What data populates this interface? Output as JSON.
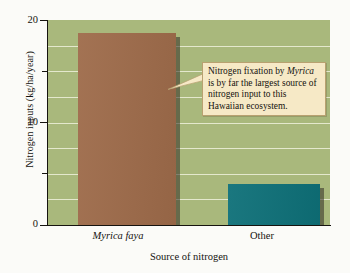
{
  "chart_data": {
    "type": "bar",
    "title": "",
    "categories": [
      "Myrica faya",
      "Other"
    ],
    "values": [
      18.7,
      4.0
    ],
    "series": [
      {
        "name": "Nitrogen inputs",
        "values": [
          18.7,
          4.0
        ]
      }
    ],
    "xlabel": "Source of nitrogen",
    "ylabel": "Nitrogen inputs (kg/ha/year)",
    "ylim": [
      0,
      20
    ],
    "yticks": [
      0,
      10,
      20
    ],
    "ytick_labels": [
      "0",
      "10",
      "20"
    ],
    "minor_yticks": [
      5,
      15
    ],
    "gridlines": [
      2.5,
      5,
      7.5,
      10,
      12.5,
      15,
      17.5
    ],
    "grid": true,
    "legend": "none",
    "bar_colors": [
      "#9e6b4a",
      "#0e7078"
    ],
    "plot_background": "#a9b87c",
    "gridline_color": "#eef0dc",
    "annotations": [
      {
        "text": "Nitrogen fixation by Myrica is by far the largest source of nitrogen input to this Hawaiian ecosystem.",
        "emphasis_word": "Myrica",
        "points_to": "Myrica faya",
        "background": "#f6e9c6",
        "border": "#b8a170"
      }
    ]
  },
  "axes": {
    "y_title": "Nitrogen inputs (kg/ha/year)",
    "x_title": "Source of nitrogen",
    "y_labels": {
      "top": "20",
      "mid": "10",
      "bottom": "0"
    },
    "x_labels": {
      "first": "Myrica faya",
      "second": "Other"
    }
  },
  "annotation": {
    "line1": "Nitrogen fixation by",
    "line2_italic": "Myrica",
    "line2_rest": "is by far the",
    "line3": "largest source of",
    "line4": "nitrogen input to this",
    "line5": "Hawaiian ecosystem."
  }
}
